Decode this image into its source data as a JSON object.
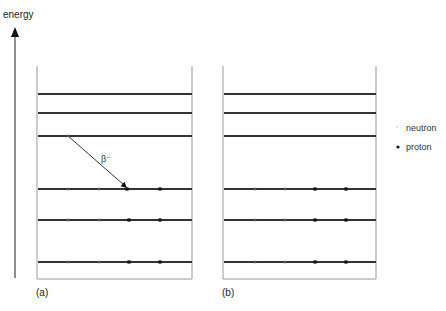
{
  "axis": {
    "label": "energy",
    "x": 15,
    "y_top": 27,
    "y_bottom": 278
  },
  "colors": {
    "level_line": "#333333",
    "frame": "#999999",
    "neutron": "#555555",
    "proton": "#111111",
    "arrow": "#333333"
  },
  "panels": [
    {
      "id": "a",
      "label": "(a)",
      "frame": {
        "left": 37,
        "right": 192,
        "top": 66,
        "bottom": 279
      },
      "levels_y": [
        94,
        113,
        136,
        189,
        220,
        262
      ],
      "particles": [
        {
          "type": "neutron",
          "x": 68,
          "y": 136
        },
        {
          "type": "neutron",
          "x": 68,
          "y": 189
        },
        {
          "type": "neutron",
          "x": 99,
          "y": 189
        },
        {
          "type": "proton",
          "x": 127,
          "y": 189
        },
        {
          "type": "proton",
          "x": 160,
          "y": 189
        },
        {
          "type": "neutron",
          "x": 68,
          "y": 220
        },
        {
          "type": "neutron",
          "x": 99,
          "y": 220
        },
        {
          "type": "proton",
          "x": 129,
          "y": 220
        },
        {
          "type": "proton",
          "x": 160,
          "y": 220
        },
        {
          "type": "neutron",
          "x": 68,
          "y": 262
        },
        {
          "type": "neutron",
          "x": 99,
          "y": 262
        },
        {
          "type": "proton",
          "x": 129,
          "y": 262
        },
        {
          "type": "proton",
          "x": 160,
          "y": 262
        }
      ],
      "decay_arrow": {
        "label": "β⁻",
        "x1": 68,
        "y1": 136,
        "x2": 127,
        "y2": 188,
        "label_x": 101,
        "label_y": 162
      }
    },
    {
      "id": "b",
      "label": "(b)",
      "frame": {
        "left": 223,
        "right": 376,
        "top": 66,
        "bottom": 279
      },
      "levels_y": [
        94,
        113,
        136,
        189,
        220,
        262
      ],
      "particles": [
        {
          "type": "neutron",
          "x": 255,
          "y": 189
        },
        {
          "type": "neutron",
          "x": 285,
          "y": 189
        },
        {
          "type": "proton",
          "x": 315,
          "y": 189
        },
        {
          "type": "proton",
          "x": 346,
          "y": 189
        },
        {
          "type": "neutron",
          "x": 255,
          "y": 220
        },
        {
          "type": "neutron",
          "x": 285,
          "y": 220
        },
        {
          "type": "proton",
          "x": 315,
          "y": 220
        },
        {
          "type": "proton",
          "x": 346,
          "y": 220
        },
        {
          "type": "neutron",
          "x": 255,
          "y": 262
        },
        {
          "type": "neutron",
          "x": 285,
          "y": 262
        },
        {
          "type": "proton",
          "x": 315,
          "y": 262
        },
        {
          "type": "proton",
          "x": 346,
          "y": 262
        }
      ]
    }
  ],
  "legend": {
    "items": [
      {
        "type": "neutron",
        "label": "neutron"
      },
      {
        "type": "proton",
        "label": "proton"
      }
    ]
  }
}
